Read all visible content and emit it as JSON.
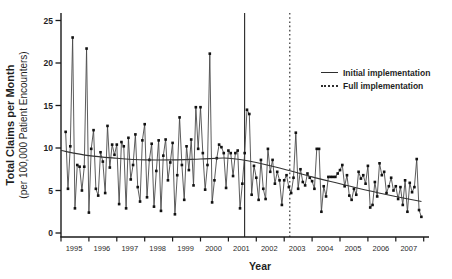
{
  "figure": {
    "ylabel_line1": "Total Claims per Month",
    "ylabel_line2": "(per 100,000 Patient Encounters)",
    "xlabel": "Year"
  },
  "chart_data": {
    "type": "line",
    "title": "",
    "xlabel": "Year",
    "ylabel": "Total Claims per Month (per 100,000 Patient Encounters)",
    "ylim": [
      0,
      25
    ],
    "y_ticks": [
      0,
      5,
      10,
      15,
      20,
      25
    ],
    "x_range_years": [
      1995,
      2008
    ],
    "x_tick_labels": [
      "1995",
      "1996",
      "1997",
      "1998",
      "1999",
      "2000",
      "2001",
      "2002",
      "2003",
      "2004",
      "2005",
      "2006",
      "2007"
    ],
    "grid": false,
    "legend_position": "upper-right",
    "series": {
      "name": "total claims per month",
      "start_year": 1995,
      "start_month": 3,
      "interval_months": 1,
      "values": [
        11.9,
        5.2,
        10.2,
        23.0,
        2.9,
        8.0,
        7.8,
        5.0,
        7.8,
        21.7,
        2.4,
        9.9,
        12.1,
        5.2,
        4.4,
        9.5,
        8.4,
        4.7,
        12.6,
        7.7,
        10.4,
        9.2,
        10.4,
        3.4,
        10.7,
        10.2,
        2.9,
        11.2,
        6.3,
        8.0,
        11.6,
        5.4,
        3.7,
        10.9,
        12.8,
        4.2,
        8.6,
        10.5,
        3.1,
        7.3,
        10.9,
        2.6,
        9.1,
        11.0,
        6.2,
        8.3,
        10.6,
        2.2,
        6.8,
        13.6,
        8.0,
        3.9,
        10.2,
        7.4,
        11.0,
        5.6,
        14.8,
        9.9,
        14.8,
        9.4,
        5.1,
        8.0,
        21.1,
        3.6,
        6.2,
        8.8,
        10.4,
        10.1,
        9.4,
        5.3,
        9.7,
        9.4,
        6.7,
        9.4,
        9.7,
        2.9,
        5.8,
        9.4,
        14.5,
        14.0,
        4.5,
        7.9,
        6.5,
        3.9,
        8.6,
        5.2,
        4.0,
        9.9,
        7.2,
        8.6,
        5.8,
        7.2,
        6.2,
        3.3,
        6.2,
        6.8,
        5.4,
        4.7,
        6.5,
        11.8,
        5.2,
        7.5,
        6.0,
        5.6,
        7.0,
        6.5,
        6.1,
        5.2,
        9.9,
        9.9,
        2.5,
        5.5,
        4.3,
        6.6,
        6.6,
        6.6,
        6.6,
        7.0,
        7.4,
        8.0,
        5.5,
        6.8,
        4.4,
        3.9,
        5.2,
        4.5,
        7.2,
        6.4,
        6.8,
        5.8,
        7.9,
        3.0,
        3.3,
        6.0,
        4.3,
        8.2,
        6.8,
        7.2,
        4.7,
        5.5,
        6.5,
        5.0,
        5.5,
        4.0,
        5.4,
        3.3,
        6.2,
        2.5,
        5.9,
        4.8,
        5.4,
        8.7,
        2.7,
        1.9
      ]
    },
    "trend_line": {
      "name": "fitted trend",
      "points": [
        [
          1995.0,
          9.7
        ],
        [
          1996,
          9.1
        ],
        [
          1997,
          8.8
        ],
        [
          1998,
          8.6
        ],
        [
          1999,
          8.6
        ],
        [
          2000,
          8.7
        ],
        [
          2001,
          8.8
        ],
        [
          2002,
          8.3
        ],
        [
          2003,
          7.5
        ],
        [
          2004,
          6.6
        ],
        [
          2005,
          5.8
        ],
        [
          2006,
          5.0
        ],
        [
          2007,
          4.3
        ],
        [
          2007.92,
          3.7
        ]
      ]
    },
    "annotations": [
      {
        "label": "Initial implementation",
        "line_style": "solid",
        "x": 2001.58
      },
      {
        "label": "Full implementation",
        "line_style": "dotted",
        "x": 2003.2
      }
    ]
  },
  "colors": {
    "background": "#ffffff",
    "axis": "#1a1a1a",
    "text": "#1f1f1f",
    "data_line": "#4a4a4a",
    "marker": "#111111",
    "trend_line": "#333333",
    "event_line": "#333333"
  }
}
